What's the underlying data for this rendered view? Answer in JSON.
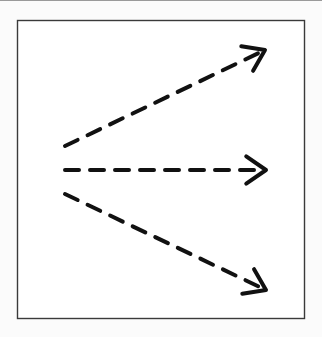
{
  "diagram": {
    "frame": {
      "x": 17,
      "y": 20,
      "width": 287,
      "height": 298,
      "stroke": "#3a3a3a"
    },
    "stroke_color": "#111111",
    "arrows": [
      {
        "name": "upper-arrow",
        "direction": "up-right",
        "x1": 65,
        "y1": 146,
        "x2": 265,
        "y2": 50
      },
      {
        "name": "middle-arrow",
        "direction": "right",
        "x1": 65,
        "y1": 170,
        "x2": 266,
        "y2": 170
      },
      {
        "name": "lower-arrow",
        "direction": "down-right",
        "x1": 65,
        "y1": 194,
        "x2": 266,
        "y2": 290
      }
    ]
  }
}
